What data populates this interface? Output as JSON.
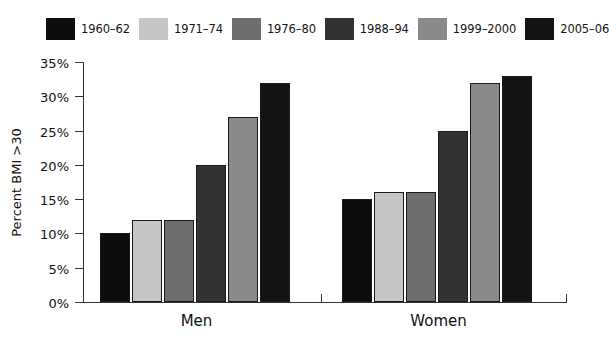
{
  "chart_data": {
    "type": "bar",
    "title": "",
    "subtitle": "",
    "xlabel": "",
    "ylabel": "Percent BMI >30",
    "ylim": [
      0,
      35
    ],
    "ytick_values": [
      35,
      30,
      25,
      20,
      15,
      10,
      5,
      0
    ],
    "ytick_labels": [
      "35%",
      "30%",
      "25%",
      "20%",
      "15%",
      "10%",
      "5%",
      "0%"
    ],
    "grid": false,
    "legend_position": "top",
    "categories": [
      "Men",
      "Women"
    ],
    "series": [
      {
        "name": "1960–62",
        "color": "#0d0d0d",
        "values": [
          10,
          15
        ]
      },
      {
        "name": "1971–74",
        "color": "#c6c6c6",
        "values": [
          12,
          16
        ]
      },
      {
        "name": "1976–80",
        "color": "#6e6e6e",
        "values": [
          12,
          16
        ]
      },
      {
        "name": "1988–94",
        "color": "#333333",
        "values": [
          20,
          25
        ]
      },
      {
        "name": "1999–2000",
        "color": "#8a8a8a",
        "values": [
          27,
          32
        ]
      },
      {
        "name": "2005–06",
        "color": "#141414",
        "values": [
          32,
          33
        ]
      }
    ]
  },
  "legend": {
    "entries": [
      {
        "label": "1960–62",
        "color": "#0d0d0d"
      },
      {
        "label": "1971–74",
        "color": "#c6c6c6"
      },
      {
        "label": "1976–80",
        "color": "#6e6e6e"
      },
      {
        "label": "1988–94",
        "color": "#333333"
      },
      {
        "label": "1999–2000",
        "color": "#8a8a8a"
      },
      {
        "label": "2005–06",
        "color": "#141414"
      }
    ]
  },
  "axes": {
    "y_title": "Percent BMI >30",
    "y_ticks": [
      "35%",
      "30%",
      "25%",
      "20%",
      "15%",
      "10%",
      "5%",
      "0%"
    ],
    "x_categories": [
      "Men",
      "Women"
    ]
  },
  "colors": {
    "axis": "#333333",
    "text": "#111111",
    "background": "#ffffff",
    "bar_outline": "#1a1a1a"
  }
}
